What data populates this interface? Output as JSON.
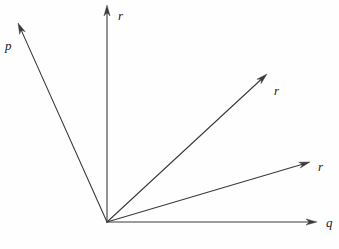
{
  "figure": {
    "kind": "vector-diagram",
    "width": 339,
    "height": 249,
    "background_color": "#fefefe",
    "stroke_color": "#3a3a3a",
    "label_color": "#1a1a1a",
    "stroke_width": 1.1,
    "origin": {
      "x": 107,
      "y": 222
    }
  },
  "vectors": [
    {
      "id": "vector-p",
      "label": "p",
      "tip": {
        "x": 18,
        "y": 23
      },
      "label_pos": {
        "x": 5,
        "y": 39
      },
      "arrowhead": true
    },
    {
      "id": "vector-r-vertical",
      "label": "r",
      "tip": {
        "x": 107,
        "y": 5
      },
      "label_pos": {
        "x": 118,
        "y": 9
      },
      "arrowhead": true
    },
    {
      "id": "vector-r-diagonal",
      "label": "r",
      "tip": {
        "x": 267,
        "y": 74
      },
      "label_pos": {
        "x": 274,
        "y": 84
      },
      "arrowhead": true
    },
    {
      "id": "vector-r-shallow",
      "label": "r",
      "tip": {
        "x": 310,
        "y": 162
      },
      "label_pos": {
        "x": 318,
        "y": 160
      },
      "arrowhead": true
    },
    {
      "id": "vector-q-horizontal",
      "label": "q",
      "tip": {
        "x": 317,
        "y": 222
      },
      "label_pos": {
        "x": 326,
        "y": 216
      },
      "arrowhead": true
    }
  ]
}
